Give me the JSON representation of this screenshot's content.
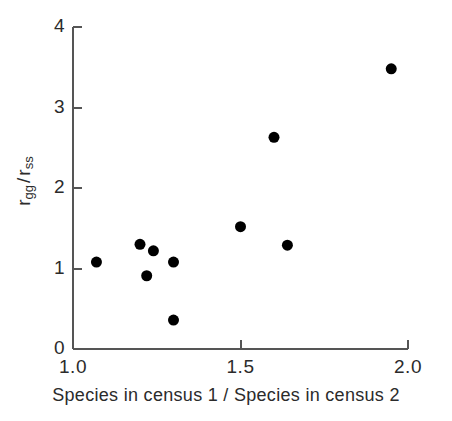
{
  "chart_data": {
    "type": "scatter",
    "title": "",
    "xlabel": "Species in  census 1 / Species in census 2",
    "ylabel": "r_gg / r_ss",
    "ylabel_parts": {
      "num_base": "r",
      "num_sub": "gg",
      "separator": "/",
      "den_base": "r",
      "den_sub": "ss"
    },
    "xlim": [
      1.0,
      2.0
    ],
    "ylim": [
      0,
      4
    ],
    "xticks": [
      1.0,
      1.5,
      2.0
    ],
    "xtick_labels": [
      "1.0",
      "1.5",
      "2.0"
    ],
    "yticks": [
      0,
      1,
      2,
      3,
      4
    ],
    "ytick_labels": [
      "0",
      "1",
      "2",
      "3",
      "4"
    ],
    "grid": false,
    "legend": false,
    "marker": "filled-circle",
    "marker_color": "#000000",
    "marker_size_px": 11,
    "axis_color": "#555555",
    "points": [
      {
        "x": 1.07,
        "y": 1.08
      },
      {
        "x": 1.2,
        "y": 1.3
      },
      {
        "x": 1.22,
        "y": 0.91
      },
      {
        "x": 1.24,
        "y": 1.22
      },
      {
        "x": 1.3,
        "y": 1.08
      },
      {
        "x": 1.3,
        "y": 0.36
      },
      {
        "x": 1.5,
        "y": 1.52
      },
      {
        "x": 1.6,
        "y": 2.63
      },
      {
        "x": 1.64,
        "y": 1.29
      },
      {
        "x": 1.95,
        "y": 3.48
      }
    ]
  }
}
